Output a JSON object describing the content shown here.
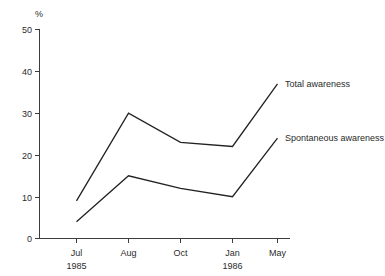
{
  "chart_data": {
    "type": "line",
    "title": "",
    "subtitle": "",
    "xlabel": "",
    "ylabel": "%",
    "ylim": [
      0,
      50
    ],
    "ytick_labels": [
      "0",
      "10",
      "20",
      "30",
      "40",
      "50"
    ],
    "yticks": [
      0,
      10,
      20,
      30,
      40,
      50
    ],
    "grid": false,
    "legend_position": "line-end-right",
    "categories": [
      "Jul",
      "Aug",
      "Oct",
      "Jan",
      "May"
    ],
    "category_sublabels": [
      "1985",
      "",
      "",
      "1986",
      ""
    ],
    "series": [
      {
        "name": "Total awareness",
        "values": [
          9,
          30,
          23,
          22,
          37
        ]
      },
      {
        "name": "Spontaneous awareness",
        "values": [
          4,
          15,
          12,
          10,
          24
        ]
      }
    ],
    "colors": {
      "line": "#222222",
      "axis": "#3c3c3c",
      "text": "#2b2b2b",
      "background": "#ffffff"
    }
  }
}
